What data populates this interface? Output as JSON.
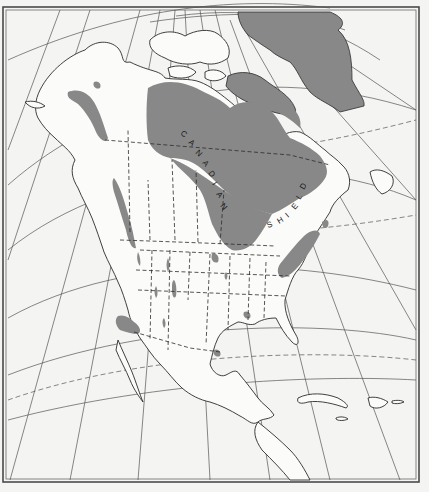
{
  "map": {
    "title": "",
    "subject": "North America — Canadian Shield and Precambrian rock outcrops",
    "region_label": "CANADIAN SHIELD",
    "label_letters_part1": [
      "C",
      "A",
      "N",
      "A",
      "D",
      "I",
      "A",
      "N"
    ],
    "label_letters_part2": [
      "S",
      "H",
      "I",
      "E",
      "L",
      "D"
    ],
    "colors": {
      "background": "#f4f4f2",
      "land": "#fbfbf9",
      "shield_fill": "#888888",
      "coastline": "#2b2b2b",
      "graticule": "#555555",
      "frame": "#4a4a4a"
    },
    "legend": []
  }
}
